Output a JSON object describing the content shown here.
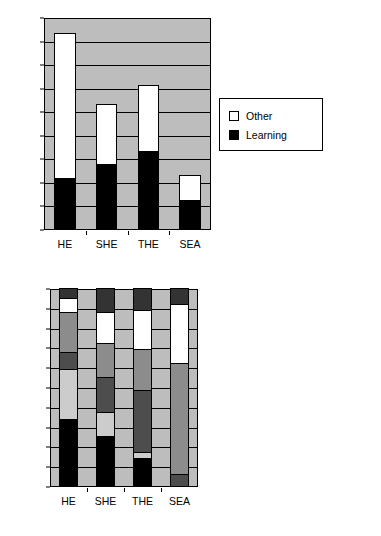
{
  "chart_data": [
    {
      "id": "top",
      "type": "bar",
      "stacked": true,
      "title": "",
      "xlabel": "",
      "ylabel": "",
      "categories": [
        "HE",
        "SHE",
        "THE",
        "SEA"
      ],
      "ylim": [
        0,
        450
      ],
      "yticks": [
        0,
        50,
        100,
        150,
        200,
        250,
        300,
        350,
        400,
        450
      ],
      "ytick_labels": [
        "0",
        "50",
        "100",
        "150",
        "200",
        "250",
        "300",
        "350",
        "400",
        "450"
      ],
      "grid": true,
      "legend_position": "right",
      "plot_background": "#bdbdbd",
      "series": [
        {
          "name": "Learning",
          "color": "#000000",
          "values": [
            108,
            137,
            165,
            62
          ]
        },
        {
          "name": "Other",
          "color": "#ffffff",
          "values": [
            309,
            128,
            140,
            53
          ]
        }
      ],
      "totals": [
        417,
        265,
        305,
        115
      ],
      "legend_entries": [
        {
          "label": "Other",
          "color": "#ffffff"
        },
        {
          "label": "Learning",
          "color": "#000000"
        }
      ]
    },
    {
      "id": "bottom",
      "type": "bar",
      "stacked": true,
      "percent": true,
      "title": "",
      "xlabel": "",
      "ylabel": "",
      "categories": [
        "HE",
        "SHE",
        "THE",
        "SEA"
      ],
      "ylim": [
        0,
        100
      ],
      "yticks": [
        0,
        10,
        20,
        30,
        40,
        50,
        60,
        70,
        80,
        90,
        100
      ],
      "ytick_labels": [
        "0%",
        "10%",
        "20%",
        "30%",
        "40%",
        "50%",
        "60%",
        "70%",
        "80%",
        "90%",
        "100%"
      ],
      "grid": true,
      "legend_position": "right",
      "plot_background": "#bdbdbd",
      "series": [
        {
          "name": "Cognitive Psychology",
          "color": "#000000",
          "values": [
            34.0,
            25.5,
            14.0,
            0.0
          ]
        },
        {
          "name": "Approaches to Learning",
          "color": "#cccccc",
          "values": [
            25.0,
            12.0,
            3.0,
            0.0
          ]
        },
        {
          "name": "Curricular innovation",
          "color": "#4d4d4d",
          "values": [
            8.5,
            17.5,
            31.5,
            6.0
          ]
        },
        {
          "name": "Social Context",
          "color": "#8c8c8c",
          "values": [
            20.5,
            17.0,
            20.5,
            56.0
          ]
        },
        {
          "name": "Critical Perspectives",
          "color": "#ffffff",
          "values": [
            7.0,
            16.0,
            20.0,
            30.0
          ]
        },
        {
          "name": "Discourse/writing",
          "color": "#333333",
          "values": [
            5.0,
            12.0,
            11.0,
            8.0
          ]
        }
      ],
      "legend_entries": [
        {
          "label": "Discourse/writing",
          "color": "#333333"
        },
        {
          "label": "Critical Perspectives",
          "color": "#ffffff"
        },
        {
          "label": "Social Context",
          "color": "#8c8c8c"
        },
        {
          "label": "Curricular innovation",
          "color": "#4d4d4d"
        },
        {
          "label": "Approaches to Learning",
          "color": "#cccccc"
        },
        {
          "label": "Cognitive Psychology",
          "color": "#000000"
        }
      ]
    }
  ]
}
